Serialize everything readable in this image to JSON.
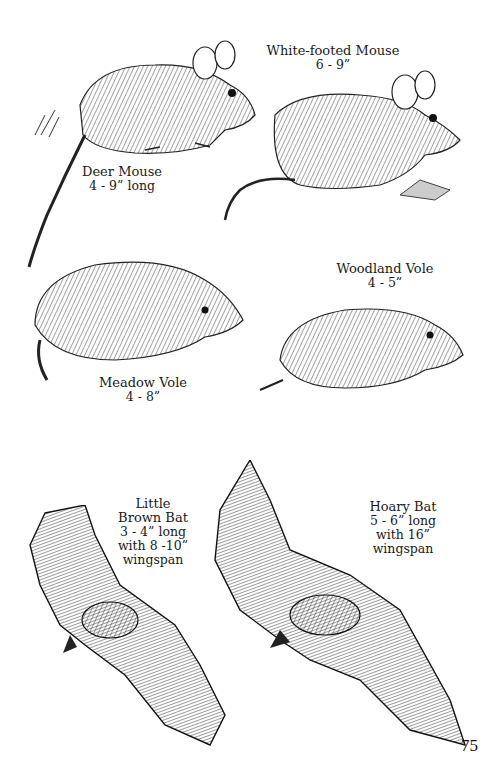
{
  "page": {
    "number": "75",
    "animals": [
      {
        "id": "white-footed-mouse",
        "name": "White-footed Mouse",
        "size": "6 - 9”"
      },
      {
        "id": "deer-mouse",
        "name": "Deer Mouse",
        "size": "4 - 9” long"
      },
      {
        "id": "woodland-vole",
        "name": "Woodland Vole",
        "size": "4 - 5”"
      },
      {
        "id": "meadow-vole",
        "name": "Meadow Vole",
        "size": "4  - 8”"
      },
      {
        "id": "little-brown-bat",
        "name_line1": "Little",
        "name_line2": "Brown Bat",
        "size": "3 - 4” long",
        "wingspan": "with 8 -10”",
        "wingspan_word": "wingspan"
      },
      {
        "id": "hoary-bat",
        "name": "Hoary Bat",
        "size": "5 - 6” long",
        "wingspan": "with 16”",
        "wingspan_word": "wingspan"
      }
    ]
  }
}
